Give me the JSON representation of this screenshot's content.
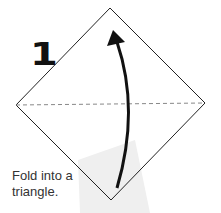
{
  "diagram": {
    "step_number": "1",
    "caption_line1": "Fold into a",
    "caption_line2": "triangle.",
    "colors": {
      "outline": "#222222",
      "fold_line": "#888888",
      "arrow": "#111111",
      "shadow": "#ededed"
    }
  }
}
